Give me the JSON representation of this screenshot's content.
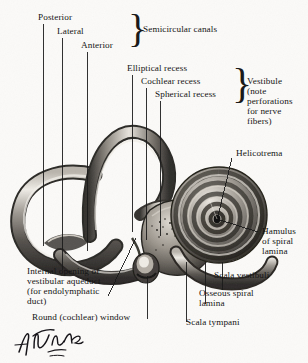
{
  "figure": {
    "signature": "F. Netter",
    "background_color": "#fbfaf8",
    "ink_color": "#1b1b1b"
  },
  "labels": {
    "posterior": "Posterior",
    "lateral": "Lateral",
    "anterior": "Anterior",
    "semicircular_canals": "Semicircular canals",
    "elliptical_recess": "Elliptical recess",
    "cochlear_recess": "Cochlear recess",
    "spherical_recess": "Spherical recess",
    "vestibule_l1": "Vestibule",
    "vestibule_l2": "(note",
    "vestibule_l3": "perforations",
    "vestibule_l4": "for nerve",
    "vestibule_l5": "fibers)",
    "helicotrema": "Helicotrema",
    "hamulus_l1": "Hamulus",
    "hamulus_l2": "of spiral",
    "hamulus_l3": "lamina",
    "scala_vestibuli": "Scala vestibuli",
    "osseous_spiral_lamina_l1": "Osseous spiral",
    "osseous_spiral_lamina_l2": "lamina",
    "scala_tympani": "Scala tympani",
    "internal_opening_l1": "Internal opening of",
    "internal_opening_l2": "vestibular aqueduct",
    "internal_opening_l3": "(for endolymphatic",
    "internal_opening_l4": "duct)",
    "round_window": "Round (cochlear) window"
  },
  "braces": {
    "semicircular_canals_brace": "}",
    "vestibule_brace": "}"
  },
  "structures": {
    "posterior_canal": "posterior-semicircular-canal",
    "lateral_canal": "lateral-semicircular-canal",
    "anterior_canal": "anterior-semicircular-canal",
    "vestibule": "vestibule",
    "cochlea": "cochlea-spiral",
    "round_window": "round-window",
    "helicotrema": "helicotrema"
  }
}
